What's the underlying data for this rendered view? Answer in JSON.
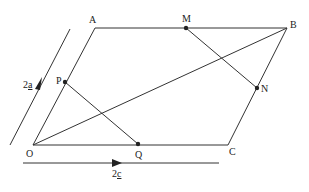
{
  "diagram": {
    "type": "parallelogram-vectors",
    "points": {
      "O": {
        "label": "O"
      },
      "A": {
        "label": "A"
      },
      "B": {
        "label": "B"
      },
      "C": {
        "label": "C"
      },
      "M": {
        "label": "M"
      },
      "N": {
        "label": "N"
      },
      "P": {
        "label": "P"
      },
      "Q": {
        "label": "Q"
      }
    },
    "vectors": {
      "oa": {
        "label_num": "2",
        "label_var": "a"
      },
      "oc": {
        "label_num": "2",
        "label_var": "c"
      }
    },
    "colors": {
      "line": "#333333",
      "background": "#ffffff"
    }
  }
}
